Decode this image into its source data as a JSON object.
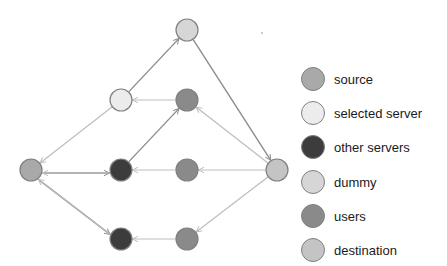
{
  "colors": {
    "source": "#a9a9a9",
    "selected_server": "#ececec",
    "other_servers": "#3c3c3c",
    "dummy": "#d6d6d6",
    "users": "#8a8a8a",
    "destination": "#c4c4c4",
    "stroke": "#808080",
    "edge_light": "#bdbdbd",
    "edge_dark": "#8c8c8c"
  },
  "legend": {
    "items": [
      {
        "key": "source",
        "label": "source"
      },
      {
        "key": "selected_server",
        "label": "selected server"
      },
      {
        "key": "other_servers",
        "label": "other servers"
      },
      {
        "key": "dummy",
        "label": "dummy"
      },
      {
        "key": "users",
        "label": "users"
      },
      {
        "key": "destination",
        "label": "destination"
      }
    ]
  },
  "graph": {
    "nodes": [
      {
        "id": "source",
        "type": "source",
        "x": 31,
        "y": 170
      },
      {
        "id": "selected",
        "type": "selected_server",
        "x": 121,
        "y": 100
      },
      {
        "id": "dummy",
        "type": "dummy",
        "x": 187,
        "y": 30
      },
      {
        "id": "user_top",
        "type": "users",
        "x": 187,
        "y": 100
      },
      {
        "id": "server_mid",
        "type": "other_servers",
        "x": 121,
        "y": 170
      },
      {
        "id": "user_mid",
        "type": "users",
        "x": 187,
        "y": 170
      },
      {
        "id": "destination",
        "type": "destination",
        "x": 277,
        "y": 170
      },
      {
        "id": "server_bot",
        "type": "other_servers",
        "x": 121,
        "y": 239
      },
      {
        "id": "user_bot",
        "type": "users",
        "x": 187,
        "y": 239
      }
    ],
    "edges": [
      {
        "from": "selected",
        "to": "source",
        "style": "light",
        "offset": 0
      },
      {
        "from": "source",
        "to": "server_mid",
        "style": "dark",
        "offset": -3
      },
      {
        "from": "server_mid",
        "to": "source",
        "style": "light",
        "offset": -3
      },
      {
        "from": "source",
        "to": "server_bot",
        "style": "dark",
        "offset": -3
      },
      {
        "from": "server_bot",
        "to": "source",
        "style": "light",
        "offset": -3
      },
      {
        "from": "selected",
        "to": "dummy",
        "style": "dark",
        "offset": 0
      },
      {
        "from": "dummy",
        "to": "destination",
        "style": "dark",
        "offset": 0
      },
      {
        "from": "user_top",
        "to": "selected",
        "style": "light",
        "offset": 0
      },
      {
        "from": "server_mid",
        "to": "user_top",
        "style": "dark",
        "offset": 0
      },
      {
        "from": "destination",
        "to": "user_top",
        "style": "light",
        "offset": 0
      },
      {
        "from": "user_mid",
        "to": "server_mid",
        "style": "light",
        "offset": 0
      },
      {
        "from": "destination",
        "to": "user_mid",
        "style": "light",
        "offset": 0
      },
      {
        "from": "destination",
        "to": "user_bot",
        "style": "light",
        "offset": 0
      },
      {
        "from": "user_bot",
        "to": "server_bot",
        "style": "light",
        "offset": 0
      }
    ],
    "radius": 11
  },
  "stray_dot": {
    "x": 262,
    "y": 33
  }
}
